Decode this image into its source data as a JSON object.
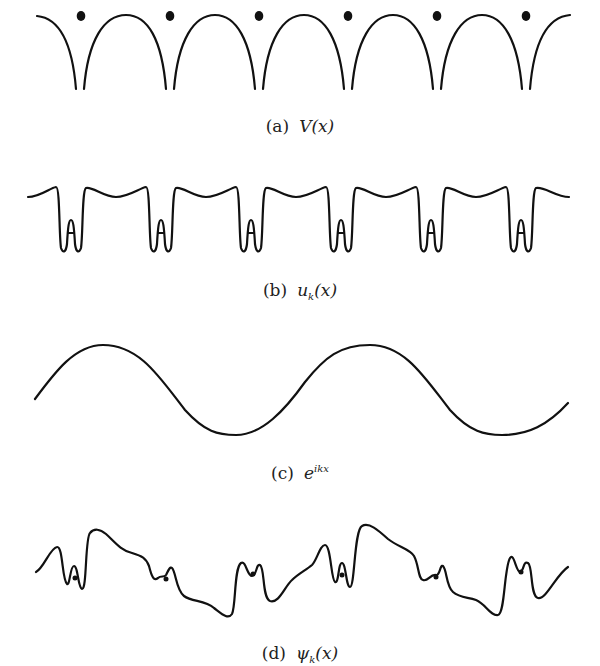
{
  "figure": {
    "stroke_color": "#111111",
    "background": "#ffffff",
    "panels": [
      {
        "id": "a",
        "label": "(a)",
        "math_main": "V(x)",
        "math_sub": "",
        "math_sup": "",
        "description": "Periodic potential of a 1D ion lattice: six ion sites (dots) with Coulomb-like singular wells between arches",
        "ion_count": 6,
        "period_px": 89
      },
      {
        "id": "b",
        "label": "(b)",
        "math_main": "u",
        "math_sub": "k",
        "math_tail": "(x)",
        "description": "Lattice-periodic function u_k(x): flat regions with deep double wells near each ion",
        "well_count": 6
      },
      {
        "id": "c",
        "label": "(c)",
        "math_main": "e",
        "math_sup": "ikx",
        "description": "Plane wave, two full oscillations across the width"
      },
      {
        "id": "d",
        "label": "(d)",
        "math_main": "ψ",
        "math_sub": "k",
        "math_tail": "(x)",
        "description": "Bloch wavefunction ψ_k(x) = u_k(x) e^{ikx}: plane-wave envelope modulated by atomic wiggles at each ion (dots)",
        "ion_count": 6
      }
    ]
  }
}
